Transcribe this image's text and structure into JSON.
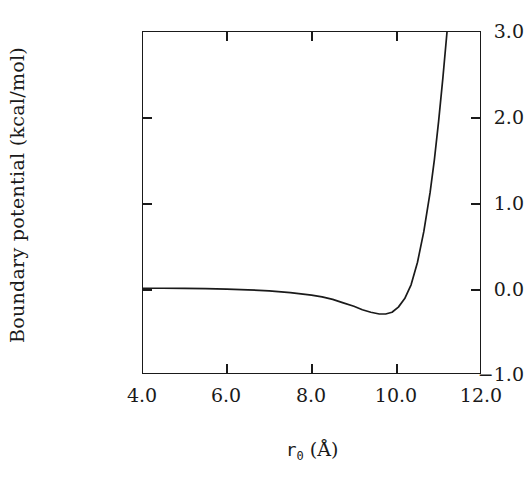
{
  "chart_data": {
    "type": "line",
    "title": "",
    "xlabel": "r_0 (Å)",
    "xlabel_symbol": "r",
    "xlabel_subscript": "0",
    "xlabel_unit": "(Å)",
    "ylabel": "Boundary potential (kcal/mol)",
    "xlim": [
      4.0,
      12.0
    ],
    "ylim": [
      -1.0,
      3.0
    ],
    "xticks": [
      "4.0",
      "6.0",
      "8.0",
      "10.0",
      "12.0"
    ],
    "xtick_values": [
      4.0,
      6.0,
      8.0,
      10.0,
      12.0
    ],
    "yticks": [
      "3.0",
      "2.0",
      "1.0",
      "0.0",
      "−1.0"
    ],
    "ytick_values": [
      3.0,
      2.0,
      1.0,
      0.0,
      -1.0
    ],
    "grid": false,
    "legend": false,
    "line_color": "#1a1a1a",
    "line_width": 1.6,
    "series": [
      {
        "name": "Boundary potential",
        "x": [
          4.0,
          4.5,
          5.0,
          5.5,
          6.0,
          6.5,
          7.0,
          7.5,
          8.0,
          8.25,
          8.5,
          8.75,
          9.0,
          9.2,
          9.4,
          9.6,
          9.75,
          9.9,
          10.05,
          10.2,
          10.35,
          10.5,
          10.65,
          10.8,
          10.9,
          11.0,
          11.1,
          11.2
        ],
        "y": [
          0.0,
          0.0,
          -0.002,
          -0.005,
          -0.01,
          -0.018,
          -0.03,
          -0.05,
          -0.08,
          -0.1,
          -0.13,
          -0.17,
          -0.21,
          -0.25,
          -0.28,
          -0.3,
          -0.3,
          -0.28,
          -0.22,
          -0.12,
          0.04,
          0.3,
          0.66,
          1.12,
          1.5,
          1.95,
          2.45,
          3.0
        ]
      }
    ],
    "annotations": {
      "minimum_x": 9.75,
      "minimum_y": -0.3,
      "zero_crossing_x": 10.3
    }
  },
  "axes": {
    "frame_color": "#1a1a1a",
    "background": "#ffffff"
  }
}
